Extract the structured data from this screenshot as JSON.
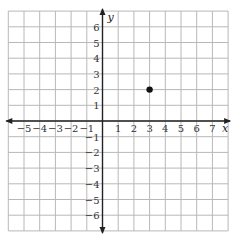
{
  "chart_data": {
    "type": "scatter",
    "title": "",
    "xlabel": "x",
    "ylabel": "y",
    "xlim": [
      -6,
      8
    ],
    "ylim": [
      -7,
      7
    ],
    "grid": true,
    "x_tick_labels": [
      "−5",
      "−4",
      "−3",
      "−2",
      "−1",
      "1",
      "2",
      "3",
      "4",
      "5",
      "6",
      "7"
    ],
    "x_ticks": [
      -5,
      -4,
      -3,
      -2,
      -1,
      1,
      2,
      3,
      4,
      5,
      6,
      7
    ],
    "y_tick_labels": [
      "6",
      "5",
      "4",
      "3",
      "2",
      "1",
      "−1",
      "−2",
      "−3",
      "−4",
      "−5",
      "−6"
    ],
    "y_ticks": [
      6,
      5,
      4,
      3,
      2,
      1,
      -1,
      -2,
      -3,
      -4,
      -5,
      -6
    ],
    "points": [
      {
        "x": 3,
        "y": 2
      }
    ],
    "colors": {
      "grid": "#b8b8b8",
      "axis": "#222222",
      "point": "#111111"
    }
  }
}
